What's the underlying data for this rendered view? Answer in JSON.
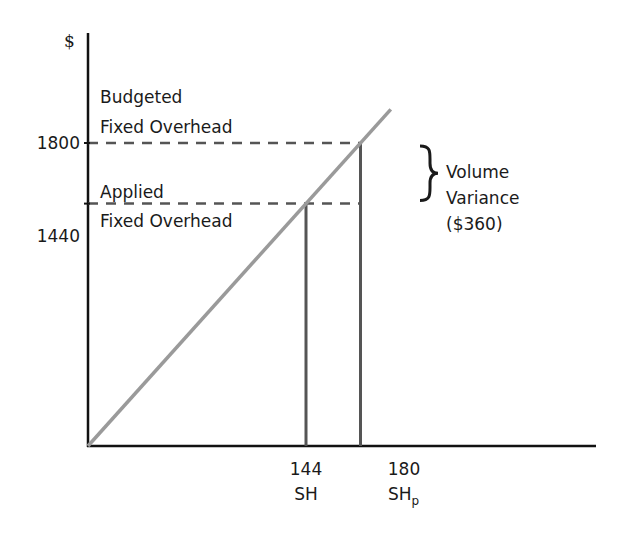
{
  "chart_data": {
    "type": "line",
    "title": "",
    "ylabel": "$",
    "xlabel": "",
    "xlim": [
      0,
      260
    ],
    "ylim": [
      0,
      2100
    ],
    "grid": false,
    "series": [
      {
        "name": "Applied fixed overhead line",
        "x": [
          0,
          200
        ],
        "y": [
          0,
          2000
        ],
        "color": "#9a9a9a"
      }
    ],
    "y_ticks": [
      {
        "value": 1800,
        "label": "1800"
      },
      {
        "value": 1440,
        "label": "1440"
      }
    ],
    "x_ticks": [
      {
        "value": 144,
        "label": "144",
        "sublabel": "SH",
        "sublabel_subscript": ""
      },
      {
        "value": 180,
        "label": "180",
        "sublabel": "SH",
        "sublabel_subscript": "p"
      }
    ],
    "reference_lines": [
      {
        "kind": "horizontal-dashed",
        "y": 1800,
        "x_to": 180
      },
      {
        "kind": "horizontal-dashed",
        "y": 1440,
        "x_to": 180
      },
      {
        "kind": "vertical",
        "x": 144,
        "y_to": 1440
      },
      {
        "kind": "vertical",
        "x": 180,
        "y_to": 1800
      }
    ],
    "annotations": [
      {
        "id": "budgeted",
        "lines": [
          "Budgeted",
          "Fixed Overhead"
        ],
        "value": 1800
      },
      {
        "id": "applied",
        "lines": [
          "Applied",
          "Fixed Overhead"
        ],
        "value": 1440
      },
      {
        "id": "variance",
        "lines": [
          "Volume",
          "Variance",
          "($360)"
        ],
        "from": 1440,
        "to": 1800
      }
    ],
    "colors": {
      "axis": "#111111",
      "diagonal": "#9a9a9a",
      "reference": "#555555",
      "text": "#1a1a1a"
    }
  }
}
